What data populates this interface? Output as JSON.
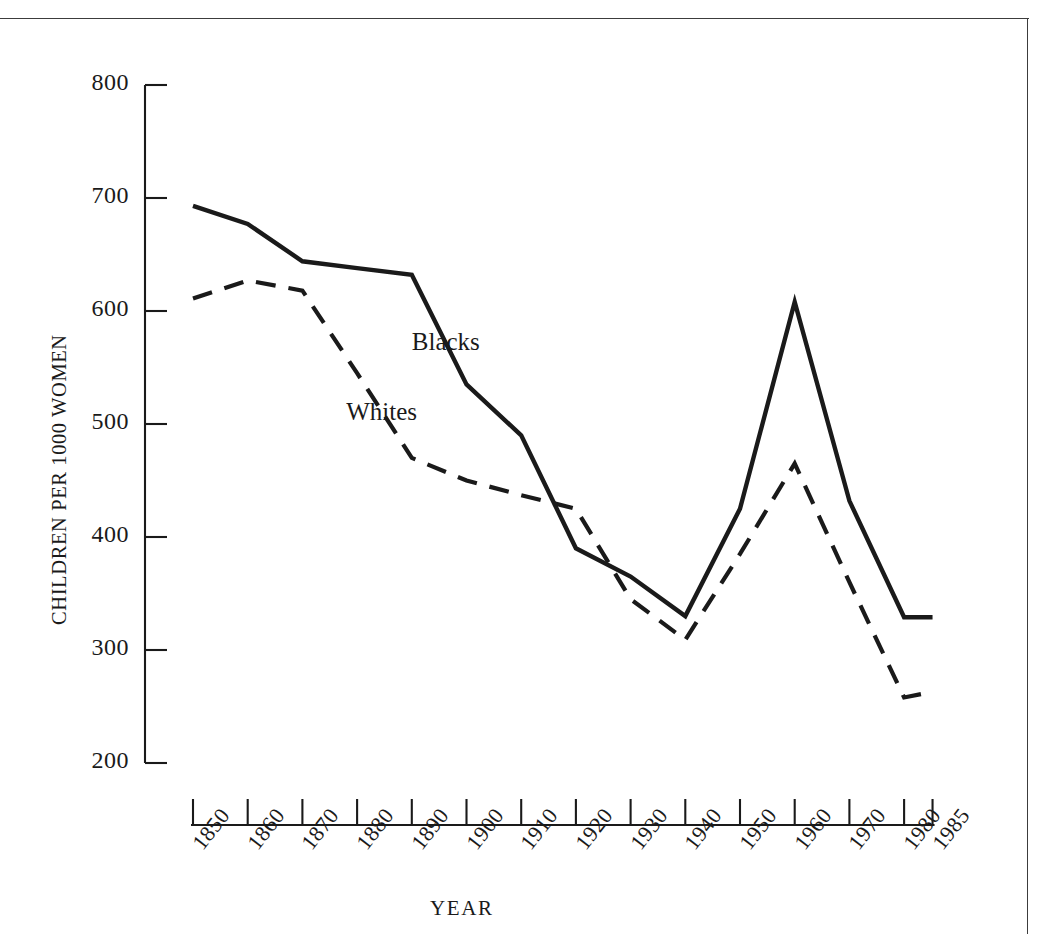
{
  "page": {
    "header_text": "",
    "frame_color": "#3c3c3c",
    "background": "#ffffff",
    "ink_color": "#1a1a1a"
  },
  "chart_data": {
    "type": "line",
    "title": "",
    "xlabel": "YEAR",
    "ylabel": "CHILDREN PER 1000 WOMEN",
    "xlim": [
      1850,
      1985
    ],
    "ylim": [
      200,
      800
    ],
    "yticks": [
      800,
      700,
      600,
      500,
      400,
      300,
      200
    ],
    "xticks": [
      "1850",
      "1860",
      "1870",
      "1880",
      "1890",
      "1900",
      "1910",
      "1920",
      "1930",
      "1940",
      "1950",
      "1960",
      "1970",
      "1980",
      "1985"
    ],
    "x": [
      1850,
      1860,
      1870,
      1880,
      1890,
      1900,
      1910,
      1920,
      1930,
      1940,
      1950,
      1960,
      1970,
      1980,
      1985
    ],
    "grid": false,
    "legend_position": "inline-annotation",
    "series": [
      {
        "name": "Blacks",
        "style": "solid",
        "color": "#1a1a1a",
        "label_x": 1890,
        "label_y": 570,
        "values": [
          693,
          677,
          644,
          638,
          632,
          535,
          490,
          390,
          365,
          330,
          425,
          608,
          432,
          329,
          329
        ]
      },
      {
        "name": "Whites",
        "style": "dashed",
        "color": "#1a1a1a",
        "label_x": 1878,
        "label_y": 508,
        "values": [
          611,
          627,
          618,
          545,
          470,
          450,
          437,
          425,
          345,
          309,
          385,
          465,
          360,
          258,
          263
        ]
      }
    ]
  }
}
